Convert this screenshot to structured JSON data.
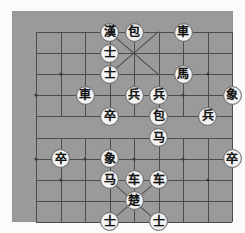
{
  "app": {
    "title": "Xiangqi Board Position",
    "kind": "chinese-chess-diagram"
  },
  "colors": {
    "mat": "#fbfbfb",
    "board": "#9a9a9a",
    "line": "#4c4c4c",
    "piece_face": "#f4f4f4",
    "piece_edge": "#6e6e6e",
    "glyph": "#141414"
  },
  "board": {
    "files": 9,
    "ranks": 10,
    "cell_w": 24.5,
    "cell_h": 21.1,
    "origin_x": 24,
    "origin_y": 21,
    "river_label": "",
    "star_points": [
      {
        "file": 1,
        "rank": 2
      },
      {
        "file": 7,
        "rank": 2
      },
      {
        "file": 0,
        "rank": 3
      },
      {
        "file": 2,
        "rank": 3
      },
      {
        "file": 4,
        "rank": 3
      },
      {
        "file": 6,
        "rank": 3
      },
      {
        "file": 8,
        "rank": 3
      },
      {
        "file": 0,
        "rank": 6
      },
      {
        "file": 2,
        "rank": 6
      },
      {
        "file": 4,
        "rank": 6
      },
      {
        "file": 6,
        "rank": 6
      },
      {
        "file": 8,
        "rank": 6
      },
      {
        "file": 1,
        "rank": 7
      },
      {
        "file": 7,
        "rank": 7
      }
    ]
  },
  "pieces": [
    {
      "id": "p01",
      "glyph": "漢",
      "name": "general-han",
      "side": "black",
      "file": 3,
      "rank": 0
    },
    {
      "id": "p02",
      "glyph": "包",
      "name": "cannon",
      "side": "black",
      "file": 4,
      "rank": 0
    },
    {
      "id": "p03",
      "glyph": "車",
      "name": "chariot",
      "side": "black",
      "file": 6,
      "rank": 0
    },
    {
      "id": "p04",
      "glyph": "士",
      "name": "advisor",
      "side": "black",
      "file": 3,
      "rank": 1
    },
    {
      "id": "p05",
      "glyph": "士",
      "name": "advisor",
      "side": "black",
      "file": 3,
      "rank": 2
    },
    {
      "id": "p06",
      "glyph": "馬",
      "name": "horse",
      "side": "black",
      "file": 6,
      "rank": 2
    },
    {
      "id": "p07",
      "glyph": "車",
      "name": "chariot",
      "side": "black",
      "file": 2,
      "rank": 3
    },
    {
      "id": "p08",
      "glyph": "兵",
      "name": "soldier",
      "side": "red",
      "file": 4,
      "rank": 3
    },
    {
      "id": "p09",
      "glyph": "兵",
      "name": "soldier",
      "side": "red",
      "file": 5,
      "rank": 3
    },
    {
      "id": "p10",
      "glyph": "象",
      "name": "elephant",
      "side": "black",
      "file": 8,
      "rank": 3
    },
    {
      "id": "p11",
      "glyph": "卒",
      "name": "pawn",
      "side": "black",
      "file": 3,
      "rank": 4
    },
    {
      "id": "p12",
      "glyph": "包",
      "name": "cannon",
      "side": "black",
      "file": 5,
      "rank": 4
    },
    {
      "id": "p13",
      "glyph": "兵",
      "name": "soldier",
      "side": "red",
      "file": 7,
      "rank": 4
    },
    {
      "id": "p14",
      "glyph": "马",
      "name": "horse",
      "side": "red",
      "file": 5,
      "rank": 5
    },
    {
      "id": "p15",
      "glyph": "卒",
      "name": "pawn",
      "side": "black",
      "file": 1,
      "rank": 6
    },
    {
      "id": "p16",
      "glyph": "象",
      "name": "elephant",
      "side": "red",
      "file": 3,
      "rank": 6
    },
    {
      "id": "p17",
      "glyph": "卒",
      "name": "pawn",
      "side": "black",
      "file": 8,
      "rank": 6
    },
    {
      "id": "p18",
      "glyph": "马",
      "name": "horse",
      "side": "red",
      "file": 3,
      "rank": 7
    },
    {
      "id": "p19",
      "glyph": "车",
      "name": "chariot",
      "side": "red",
      "file": 4,
      "rank": 7
    },
    {
      "id": "p20",
      "glyph": "车",
      "name": "chariot",
      "side": "red",
      "file": 5,
      "rank": 7
    },
    {
      "id": "p21",
      "glyph": "楚",
      "name": "general-chu",
      "side": "red",
      "file": 4,
      "rank": 8
    },
    {
      "id": "p22",
      "glyph": "士",
      "name": "advisor",
      "side": "red",
      "file": 3,
      "rank": 9
    },
    {
      "id": "p23",
      "glyph": "士",
      "name": "advisor",
      "side": "red",
      "file": 5,
      "rank": 9
    }
  ]
}
